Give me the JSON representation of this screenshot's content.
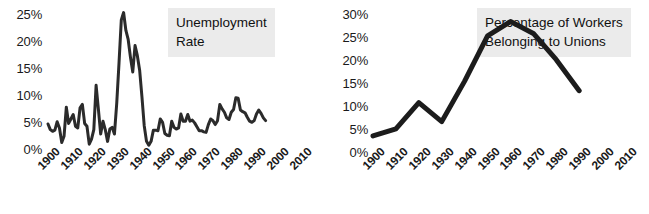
{
  "figure": {
    "background": "#ffffff",
    "line_color": "#2b2b2b",
    "title_box_background": "#ebebeb",
    "text_color": "#1a1a1a"
  },
  "charts": [
    {
      "id": "unemployment",
      "title_line1": "Unemployment",
      "title_line2": "Rate",
      "ylabels": [
        "25%",
        "20%",
        "15%",
        "10%",
        "5%",
        "0%"
      ],
      "xlabels": [
        "1900",
        "1910",
        "1920",
        "1930",
        "1940",
        "1950",
        "1960",
        "1970",
        "1980",
        "1990",
        "2000",
        "2010"
      ]
    },
    {
      "id": "union-membership",
      "title_line1": "Percentage of Workers",
      "title_line2": "Belonging to Unions",
      "ylabels": [
        "30%",
        "25%",
        "20%",
        "15%",
        "10%",
        "5%",
        "0%"
      ],
      "xlabels": [
        "1900",
        "1910",
        "1920",
        "1930",
        "1940",
        "1950",
        "1960",
        "1970",
        "1980",
        "1990",
        "2000",
        "2010"
      ]
    }
  ],
  "chart_data": [
    {
      "type": "line",
      "title": "Unemployment Rate",
      "xlabel": "",
      "ylabel": "",
      "xlim": [
        1900,
        2010
      ],
      "ylim": [
        0,
        25
      ],
      "grid": false,
      "legend": "none",
      "ytick_values": [
        0,
        5,
        10,
        15,
        20,
        25
      ],
      "ytick_labels": [
        "0%",
        "5%",
        "10%",
        "15%",
        "20%",
        "25%"
      ],
      "xtick_values": [
        1900,
        1910,
        1920,
        1930,
        1940,
        1950,
        1960,
        1970,
        1980,
        1990,
        2000,
        2010
      ],
      "xtick_labels": [
        "1900",
        "1910",
        "1920",
        "1930",
        "1940",
        "1950",
        "1960",
        "1970",
        "1980",
        "1990",
        "2000",
        "2010"
      ],
      "x": [
        1900,
        1901,
        1902,
        1903,
        1904,
        1905,
        1906,
        1907,
        1908,
        1909,
        1910,
        1911,
        1912,
        1913,
        1914,
        1915,
        1916,
        1917,
        1918,
        1919,
        1920,
        1921,
        1922,
        1923,
        1924,
        1925,
        1926,
        1927,
        1928,
        1929,
        1930,
        1931,
        1932,
        1933,
        1934,
        1935,
        1936,
        1937,
        1938,
        1939,
        1940,
        1941,
        1942,
        1943,
        1944,
        1945,
        1946,
        1947,
        1948,
        1949,
        1950,
        1951,
        1952,
        1953,
        1954,
        1955,
        1956,
        1957,
        1958,
        1959,
        1960,
        1961,
        1962,
        1963,
        1964,
        1965,
        1966,
        1967,
        1968,
        1969,
        1970,
        1971,
        1972,
        1973,
        1974,
        1975,
        1976,
        1977,
        1978,
        1979,
        1980,
        1981,
        1982,
        1983,
        1984,
        1985,
        1986,
        1987,
        1988,
        1989,
        1990,
        1991,
        1992,
        1993,
        1994,
        1995
      ],
      "y": [
        5.0,
        4.0,
        3.7,
        3.9,
        5.4,
        4.3,
        1.7,
        2.8,
        8.0,
        5.1,
        5.9,
        6.7,
        4.6,
        4.3,
        7.9,
        8.5,
        5.1,
        4.6,
        1.4,
        2.3,
        4.0,
        11.9,
        7.6,
        3.2,
        5.5,
        4.0,
        1.9,
        4.1,
        4.4,
        3.2,
        8.7,
        15.9,
        23.6,
        24.9,
        21.7,
        20.1,
        16.9,
        14.3,
        19.0,
        17.2,
        14.6,
        9.9,
        4.7,
        1.9,
        1.2,
        1.9,
        3.9,
        3.9,
        3.8,
        5.9,
        5.3,
        3.3,
        3.0,
        2.9,
        5.5,
        4.4,
        4.1,
        4.3,
        6.8,
        5.5,
        5.5,
        6.7,
        5.5,
        5.7,
        5.2,
        4.5,
        3.8,
        3.8,
        3.6,
        3.5,
        4.9,
        5.9,
        5.6,
        4.9,
        5.6,
        8.5,
        7.7,
        7.1,
        6.1,
        5.8,
        7.1,
        7.6,
        9.7,
        9.6,
        7.5,
        7.2,
        7.0,
        6.2,
        5.5,
        5.3,
        5.6,
        6.8,
        7.5,
        6.9,
        6.1,
        5.6
      ]
    },
    {
      "type": "line",
      "title": "Percentage of Workers Belonging to Unions",
      "xlabel": "",
      "ylabel": "",
      "xlim": [
        1900,
        2010
      ],
      "ylim": [
        0,
        30
      ],
      "grid": false,
      "legend": "none",
      "ytick_values": [
        0,
        5,
        10,
        15,
        20,
        25,
        30
      ],
      "ytick_labels": [
        "0%",
        "5%",
        "10%",
        "15%",
        "20%",
        "25%",
        "30%"
      ],
      "xtick_values": [
        1900,
        1910,
        1920,
        1930,
        1940,
        1950,
        1960,
        1970,
        1980,
        1990,
        2000,
        2010
      ],
      "xtick_labels": [
        "1900",
        "1910",
        "1920",
        "1930",
        "1940",
        "1950",
        "1960",
        "1970",
        "1980",
        "1990",
        "2000",
        "2010"
      ],
      "x": [
        1900,
        1910,
        1920,
        1930,
        1940,
        1950,
        1960,
        1970,
        1980,
        1990
      ],
      "y": [
        4.0,
        5.5,
        11.0,
        7.0,
        15.5,
        25.0,
        28.0,
        25.5,
        20.0,
        13.5
      ]
    }
  ]
}
